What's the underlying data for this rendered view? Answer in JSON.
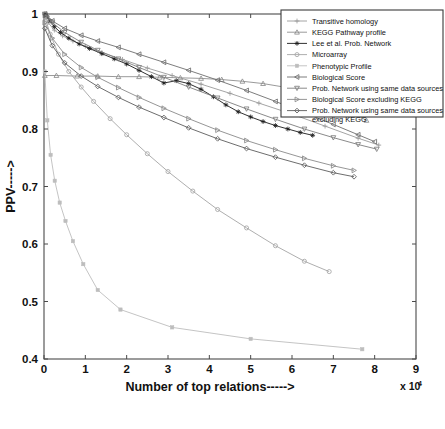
{
  "chart_data": {
    "type": "line",
    "title": "",
    "xlabel": "Number of top relations----->",
    "ylabel": "PPV----->",
    "x_multiplier": "x 10",
    "x_multiplier_exp": "4",
    "xlim": [
      0,
      9
    ],
    "ylim": [
      0.4,
      1.0
    ],
    "xticks": [
      "0",
      "1",
      "2",
      "3",
      "4",
      "5",
      "6",
      "7",
      "8",
      "9"
    ],
    "xtick_values": [
      0,
      1,
      2,
      3,
      4,
      5,
      6,
      7,
      8,
      9
    ],
    "yticks": [
      "0.4",
      "0.5",
      "0.6",
      "0.7",
      "0.8",
      "0.9",
      "1"
    ],
    "ytick_values": [
      0.4,
      0.5,
      0.6,
      0.7,
      0.8,
      0.9,
      1.0
    ],
    "grid": false,
    "legend_position": "top-right",
    "series": [
      {
        "name": "Transitive homology",
        "marker": "plus",
        "color": "#9a9a9a",
        "x": [
          0.02,
          0.1,
          0.25,
          0.45,
          0.7,
          1.0,
          1.4,
          1.9,
          2.5,
          3.1,
          3.8,
          4.5,
          5.2,
          6.0,
          6.8,
          7.6,
          8.1
        ],
        "y": [
          0.998,
          0.985,
          0.972,
          0.962,
          0.953,
          0.944,
          0.933,
          0.921,
          0.906,
          0.893,
          0.878,
          0.862,
          0.845,
          0.826,
          0.805,
          0.784,
          0.772
        ]
      },
      {
        "name": "KEGG Pathway profile",
        "marker": "triangle-up",
        "color": "#8e8e8e",
        "x": [
          0.02,
          0.3,
          0.8,
          1.3,
          1.8,
          2.3,
          2.8,
          3.3,
          3.8,
          4.3,
          4.8,
          5.3,
          5.8,
          6.3,
          6.8,
          7.3,
          7.8
        ],
        "y": [
          0.893,
          0.893,
          0.892,
          0.892,
          0.891,
          0.891,
          0.89,
          0.889,
          0.888,
          0.886,
          0.883,
          0.879,
          0.873,
          0.864,
          0.852,
          0.836,
          0.815
        ]
      },
      {
        "name": "Lee et al. Prob. Network",
        "marker": "asterisk",
        "color": "#1a1a1a",
        "x": [
          0.02,
          0.08,
          0.15,
          0.25,
          0.4,
          0.6,
          0.85,
          1.1,
          1.4,
          1.7,
          2.0,
          2.3,
          2.6,
          2.9,
          3.2,
          3.5,
          3.8,
          4.1,
          4.4,
          4.7,
          5.0,
          5.3,
          5.6,
          5.9,
          6.2,
          6.5
        ],
        "y": [
          1.0,
          0.995,
          0.988,
          0.978,
          0.968,
          0.958,
          0.948,
          0.94,
          0.931,
          0.922,
          0.913,
          0.902,
          0.891,
          0.88,
          0.884,
          0.879,
          0.869,
          0.856,
          0.842,
          0.83,
          0.821,
          0.813,
          0.806,
          0.8,
          0.794,
          0.789
        ]
      },
      {
        "name": "Microarray",
        "marker": "circle",
        "color": "#a5a5a5",
        "x": [
          0.02,
          0.15,
          0.35,
          0.6,
          0.9,
          1.2,
          1.6,
          2.0,
          2.5,
          3.0,
          3.6,
          4.2,
          4.9,
          5.6,
          6.3,
          6.9
        ],
        "y": [
          0.995,
          0.965,
          0.93,
          0.9,
          0.873,
          0.848,
          0.818,
          0.79,
          0.757,
          0.726,
          0.692,
          0.66,
          0.628,
          0.597,
          0.57,
          0.552
        ]
      },
      {
        "name": "Phenotypic Profile",
        "marker": "dot",
        "color": "#bdbdbd",
        "x": [
          0.02,
          0.08,
          0.16,
          0.26,
          0.38,
          0.52,
          0.7,
          0.95,
          1.3,
          1.85,
          3.1,
          5.0,
          7.7
        ],
        "y": [
          0.9,
          0.815,
          0.755,
          0.71,
          0.672,
          0.64,
          0.605,
          0.565,
          0.52,
          0.486,
          0.455,
          0.435,
          0.417
        ]
      },
      {
        "name": "Biological Score",
        "marker": "triangle-left",
        "color": "#6e6e6e",
        "x": [
          0.02,
          0.2,
          0.5,
          0.9,
          1.3,
          1.8,
          2.3,
          2.9,
          3.5,
          4.2,
          4.9,
          5.6,
          6.3,
          7.0,
          7.6,
          8.0
        ],
        "y": [
          1.0,
          0.988,
          0.975,
          0.963,
          0.953,
          0.942,
          0.93,
          0.916,
          0.902,
          0.885,
          0.867,
          0.848,
          0.828,
          0.808,
          0.79,
          0.778
        ]
      },
      {
        "name": "Prob. Network using same data sources",
        "marker": "triangle-down",
        "color": "#7d7d7d",
        "x": [
          0.02,
          0.2,
          0.5,
          0.9,
          1.3,
          1.8,
          2.3,
          2.9,
          3.5,
          4.2,
          4.9,
          5.6,
          6.3,
          7.0,
          7.6,
          8.05
        ],
        "y": [
          1.0,
          0.985,
          0.968,
          0.951,
          0.937,
          0.922,
          0.907,
          0.89,
          0.873,
          0.854,
          0.835,
          0.817,
          0.8,
          0.785,
          0.773,
          0.765
        ]
      },
      {
        "name": "Biological Score excluding KEGG",
        "marker": "triangle-right",
        "color": "#8a8a8a",
        "x": [
          0.02,
          0.2,
          0.5,
          0.9,
          1.3,
          1.8,
          2.3,
          2.9,
          3.5,
          4.2,
          4.9,
          5.6,
          6.3,
          7.0,
          7.5
        ],
        "y": [
          0.985,
          0.958,
          0.93,
          0.907,
          0.89,
          0.872,
          0.855,
          0.836,
          0.818,
          0.798,
          0.78,
          0.764,
          0.749,
          0.736,
          0.728
        ]
      },
      {
        "name": "Prob. Network using same data sources excluding KEGG",
        "marker": "diamond",
        "color": "#5c5c5c",
        "x": [
          0.02,
          0.2,
          0.5,
          0.9,
          1.3,
          1.8,
          2.3,
          2.9,
          3.5,
          4.2,
          4.9,
          5.6,
          6.3,
          7.0,
          7.5
        ],
        "y": [
          0.975,
          0.945,
          0.915,
          0.892,
          0.874,
          0.855,
          0.838,
          0.82,
          0.802,
          0.783,
          0.766,
          0.751,
          0.737,
          0.724,
          0.717
        ]
      }
    ]
  },
  "legend": {
    "items": [
      "Transitive homology",
      "KEGG Pathway profile",
      "Lee et al. Prob. Network",
      "Microarray",
      "Phenotypic Profile",
      "Biological Score",
      "Prob. Network using same data sources",
      "Biological Score excluding KEGG",
      "Prob. Network using same data sources",
      "excluding KEGG"
    ]
  }
}
